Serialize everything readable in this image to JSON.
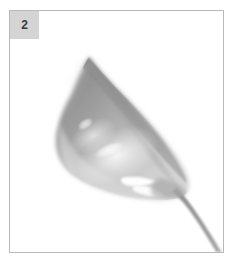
{
  "figure": {
    "panel_background": "#ffffff",
    "panel_border_color": "#b9b9b9",
    "outer_background": "#ffffff"
  },
  "badge": {
    "label": "2",
    "background": "#d4d4d4",
    "text_color": "#3b3b3b"
  },
  "specimen": {
    "subject_name": "leaf-specimen",
    "style": "watercolor-grayscale",
    "orientation": "tip-upper-left-base-lower-right",
    "tones": {
      "darkest": "#8b8b8b",
      "mid": "#a8a8a8",
      "light": "#c8c8c8",
      "pale": "#e2e2e2",
      "highlight": "#ffffff",
      "stem": "#9a9a9a"
    }
  }
}
